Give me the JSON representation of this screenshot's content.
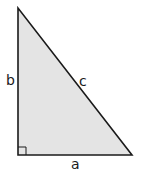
{
  "diagram": {
    "type": "right-triangle",
    "fill_color": "#e4e4e4",
    "stroke_color": "#1a1a1a",
    "labels": {
      "leg_vertical": "b",
      "hypotenuse": "c",
      "leg_horizontal": "a"
    },
    "right_angle_marker": true
  }
}
